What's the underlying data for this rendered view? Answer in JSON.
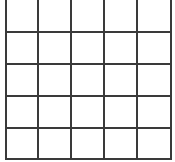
{
  "grid": {
    "rows": 5,
    "cols": 5,
    "line_color": "#3a3a3a",
    "background": "#ffffff",
    "vertical_lines_x": [
      5,
      37,
      70,
      103,
      136,
      170
    ],
    "horizontal_lines_y": [
      31,
      63,
      95,
      127,
      158
    ],
    "top_border": false,
    "cells": [
      [
        "",
        "",
        "",
        "",
        ""
      ],
      [
        "",
        "",
        "",
        "",
        ""
      ],
      [
        "",
        "",
        "",
        "",
        ""
      ],
      [
        "",
        "",
        "",
        "",
        ""
      ],
      [
        "",
        "",
        "",
        "",
        ""
      ]
    ]
  }
}
